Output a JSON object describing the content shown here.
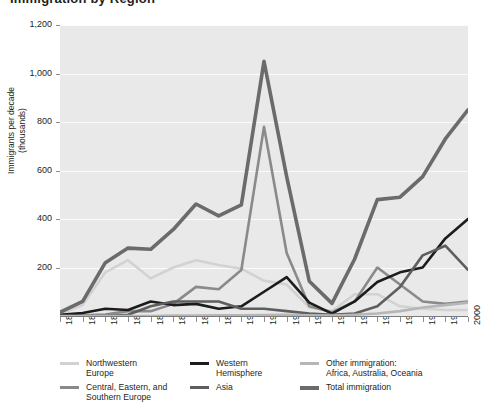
{
  "figure": {
    "title_fragment": "Immigration by Region",
    "background": "#ffffff",
    "plot_background": "#e9e9e9",
    "gridline_color": "#fbfbfb"
  },
  "axes": {
    "y_title": "Immigrants per decade\n(thousands)",
    "y_ticks": [
      "1,200",
      "1,000",
      "800",
      "600",
      "400",
      "200"
    ],
    "y_tick_values": [
      1200,
      1000,
      800,
      600,
      400,
      200
    ],
    "x_ticks": [
      "1820",
      "1830",
      "1840",
      "1850",
      "1860",
      "1870",
      "1880",
      "1890",
      "1900",
      "1910",
      "1920",
      "1930",
      "1940",
      "1950",
      "1960",
      "1970",
      "1980",
      "1990",
      "2000"
    ]
  },
  "legend": {
    "items": [
      {
        "label": "Northwestern\nEurope",
        "color": "#d2d2d2",
        "thick": false,
        "name": "northwestern-europe"
      },
      {
        "label": "Central, Eastern, and\nSouthern Europe",
        "color": "#8a8a8a",
        "thick": false,
        "name": "central-eastern-southern-europe"
      },
      {
        "label": "Western\nHemisphere",
        "color": "#1c1c1c",
        "thick": false,
        "name": "western-hemisphere"
      },
      {
        "label": "Asia",
        "color": "#5e5e5e",
        "thick": false,
        "name": "asia"
      },
      {
        "label": "Other immigration:\nAfrica, Australia, Oceania",
        "color": "#b6b6b6",
        "thick": false,
        "name": "other-immigration"
      },
      {
        "label": "Total immigration",
        "color": "#6b6b6b",
        "thick": true,
        "name": "total-immigration"
      }
    ]
  },
  "chart_data": {
    "type": "line",
    "title": "Immigration by Region",
    "xlabel": "",
    "ylabel": "Immigrants per decade (thousands)",
    "xlim": [
      1820,
      2000
    ],
    "ylim": [
      0,
      1200
    ],
    "grid": true,
    "legend_position": "bottom",
    "x": [
      1820,
      1830,
      1840,
      1850,
      1860,
      1870,
      1880,
      1890,
      1900,
      1910,
      1920,
      1930,
      1940,
      1950,
      1960,
      1970,
      1980,
      1990,
      2000
    ],
    "series": [
      {
        "name": "Northwestern Europe",
        "color": "#d2d2d2",
        "width": 2.6,
        "values": [
          8,
          45,
          180,
          230,
          155,
          200,
          230,
          210,
          195,
          145,
          130,
          35,
          20,
          90,
          90,
          40,
          30,
          25,
          25
        ]
      },
      {
        "name": "Central, Eastern, and Southern Europe",
        "color": "#8a8a8a",
        "width": 2.6,
        "values": [
          2,
          3,
          6,
          20,
          20,
          50,
          120,
          110,
          190,
          780,
          260,
          40,
          15,
          60,
          200,
          130,
          60,
          50,
          60
        ]
      },
      {
        "name": "Western Hemisphere",
        "color": "#1c1c1c",
        "width": 2.6,
        "values": [
          5,
          12,
          30,
          25,
          60,
          45,
          50,
          30,
          40,
          100,
          160,
          55,
          10,
          60,
          140,
          180,
          200,
          320,
          400
        ]
      },
      {
        "name": "Asia",
        "color": "#5e5e5e",
        "width": 2.6,
        "values": [
          0,
          0,
          0,
          5,
          40,
          60,
          60,
          60,
          30,
          30,
          20,
          10,
          5,
          10,
          40,
          120,
          250,
          290,
          190
        ]
      },
      {
        "name": "Other immigration: Africa, Australia, Oceania",
        "color": "#b6b6b6",
        "width": 2.6,
        "values": [
          0,
          0,
          0,
          0,
          0,
          2,
          2,
          3,
          3,
          4,
          5,
          3,
          2,
          5,
          10,
          20,
          35,
          45,
          55
        ]
      },
      {
        "name": "Total immigration",
        "color": "#6b6b6b",
        "width": 3.6,
        "values": [
          15,
          60,
          220,
          280,
          275,
          357,
          462,
          413,
          458,
          1050,
          575,
          143,
          52,
          235,
          480,
          490,
          575,
          730,
          850
        ]
      }
    ]
  }
}
